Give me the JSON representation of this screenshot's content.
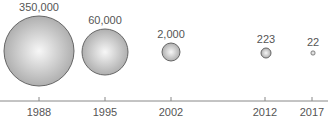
{
  "chart_data": {
    "type": "bubble",
    "title": "",
    "xlabel": "",
    "ylabel": "",
    "categories": [
      "1988",
      "1995",
      "2002",
      "2012",
      "2017"
    ],
    "values": [
      350000,
      60000,
      2000,
      223,
      22
    ],
    "value_labels": [
      "350,000",
      "60,000",
      "2,000",
      "223",
      "22"
    ],
    "grid": false,
    "legend": null
  },
  "bubbles": [
    {
      "year": "1988",
      "label": "350,000",
      "cx": 39,
      "cy": 51,
      "r": 35,
      "tick_x": 39
    },
    {
      "year": "1995",
      "label": "60,000",
      "cx": 105,
      "cy": 52,
      "r": 23,
      "tick_x": 105
    },
    {
      "year": "2002",
      "label": "2,000",
      "cx": 171,
      "cy": 52,
      "r": 9,
      "tick_x": 171
    },
    {
      "year": "2012",
      "label": "223",
      "cx": 266,
      "cy": 53,
      "r": 5,
      "tick_x": 265
    },
    {
      "year": "2017",
      "label": "22",
      "cx": 313,
      "cy": 53,
      "r": 2.2,
      "tick_x": 312
    }
  ],
  "colors": {
    "bubble_center": "#f7f7f7",
    "bubble_edge": "#a8a8a8",
    "bubble_stroke": "#666666",
    "axis": "#888888",
    "text": "#555555"
  }
}
